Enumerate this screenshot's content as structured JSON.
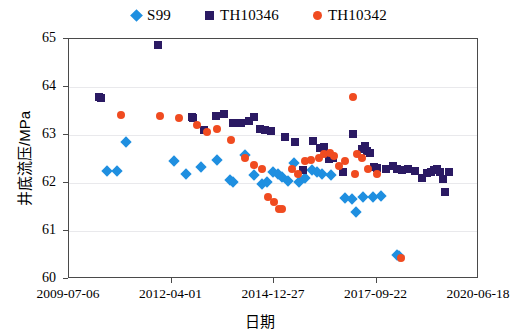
{
  "chart_data": {
    "type": "scatter",
    "title": "",
    "xlabel": "日期",
    "ylabel": "井底流压/MPa",
    "grid": true,
    "legend_position": "top-center",
    "ylim": [
      60,
      65
    ],
    "yticks": [
      60,
      61,
      62,
      63,
      64,
      65
    ],
    "ytick_labels": [
      "60",
      "61",
      "62",
      "63",
      "64",
      "65"
    ],
    "xlim": [
      "2009-07-06",
      "2020-06-18"
    ],
    "xticks": [
      "2009-07-06",
      "2012-04-01",
      "2014-12-27",
      "2017-09-22",
      "2020-06-18"
    ],
    "xtick_labels": [
      "2009-07-06",
      "2012-04-01",
      "2014-12-27",
      "2017-09-22",
      "2020-06-18"
    ],
    "x_axis_type": "date",
    "series": [
      {
        "name": "S99",
        "marker": "diamond",
        "color": "#1f8fe0",
        "points": [
          [
            0.092,
            62.26
          ],
          [
            0.116,
            62.26
          ],
          [
            0.14,
            62.85
          ],
          [
            0.255,
            62.45
          ],
          [
            0.285,
            62.18
          ],
          [
            0.323,
            62.33
          ],
          [
            0.36,
            62.48
          ],
          [
            0.392,
            62.07
          ],
          [
            0.4,
            62.02
          ],
          [
            0.43,
            62.58
          ],
          [
            0.452,
            62.16
          ],
          [
            0.47,
            61.97
          ],
          [
            0.482,
            62.02
          ],
          [
            0.497,
            62.22
          ],
          [
            0.51,
            62.18
          ],
          [
            0.52,
            62.13
          ],
          [
            0.533,
            62.05
          ],
          [
            0.548,
            62.42
          ],
          [
            0.56,
            62.02
          ],
          [
            0.575,
            62.1
          ],
          [
            0.592,
            62.27
          ],
          [
            0.604,
            62.23
          ],
          [
            0.618,
            62.18
          ],
          [
            0.64,
            62.16
          ],
          [
            0.672,
            61.68
          ],
          [
            0.69,
            61.66
          ],
          [
            0.7,
            61.4
          ],
          [
            0.716,
            61.7
          ],
          [
            0.742,
            61.7
          ],
          [
            0.762,
            61.72
          ],
          [
            0.8,
            60.5
          ],
          [
            0.805,
            60.48
          ]
        ]
      },
      {
        "name": "TH10346",
        "marker": "square",
        "color": "#2b1a63",
        "points": [
          [
            0.073,
            63.8
          ],
          [
            0.078,
            63.78
          ],
          [
            0.216,
            64.88
          ],
          [
            0.3,
            63.38
          ],
          [
            0.303,
            63.36
          ],
          [
            0.33,
            63.1
          ],
          [
            0.358,
            63.4
          ],
          [
            0.378,
            63.43
          ],
          [
            0.4,
            63.25
          ],
          [
            0.42,
            63.25
          ],
          [
            0.438,
            63.3
          ],
          [
            0.452,
            63.37
          ],
          [
            0.466,
            63.12
          ],
          [
            0.478,
            63.1
          ],
          [
            0.492,
            63.08
          ],
          [
            0.528,
            62.95
          ],
          [
            0.552,
            62.85
          ],
          [
            0.57,
            62.27
          ],
          [
            0.596,
            62.87
          ],
          [
            0.612,
            62.73
          ],
          [
            0.622,
            62.76
          ],
          [
            0.634,
            62.5
          ],
          [
            0.645,
            62.52
          ],
          [
            0.668,
            62.23
          ],
          [
            0.692,
            63.02
          ],
          [
            0.714,
            62.7
          ],
          [
            0.722,
            62.78
          ],
          [
            0.726,
            62.66
          ],
          [
            0.735,
            62.62
          ],
          [
            0.745,
            62.34
          ],
          [
            0.752,
            62.32
          ],
          [
            0.772,
            62.3
          ],
          [
            0.79,
            62.36
          ],
          [
            0.8,
            62.3
          ],
          [
            0.812,
            62.28
          ],
          [
            0.828,
            62.3
          ],
          [
            0.845,
            62.24
          ],
          [
            0.862,
            62.1
          ],
          [
            0.872,
            62.2
          ],
          [
            0.882,
            62.22
          ],
          [
            0.89,
            62.28
          ],
          [
            0.898,
            62.3
          ],
          [
            0.905,
            62.22
          ],
          [
            0.912,
            62.08
          ],
          [
            0.926,
            62.22
          ],
          [
            0.918,
            61.82
          ]
        ]
      },
      {
        "name": "TH10342",
        "marker": "circle",
        "color": "#f04b20",
        "points": [
          [
            0.128,
            63.42
          ],
          [
            0.222,
            63.4
          ],
          [
            0.268,
            63.35
          ],
          [
            0.312,
            63.2
          ],
          [
            0.336,
            63.06
          ],
          [
            0.36,
            63.12
          ],
          [
            0.395,
            62.9
          ],
          [
            0.43,
            62.52
          ],
          [
            0.452,
            62.38
          ],
          [
            0.47,
            62.3
          ],
          [
            0.486,
            61.7
          ],
          [
            0.5,
            61.6
          ],
          [
            0.512,
            61.46
          ],
          [
            0.52,
            61.45
          ],
          [
            0.545,
            62.3
          ],
          [
            0.558,
            62.18
          ],
          [
            0.575,
            62.45
          ],
          [
            0.59,
            62.47
          ],
          [
            0.61,
            62.52
          ],
          [
            0.622,
            62.6
          ],
          [
            0.637,
            62.62
          ],
          [
            0.646,
            62.56
          ],
          [
            0.658,
            62.35
          ],
          [
            0.672,
            62.45
          ],
          [
            0.692,
            63.8
          ],
          [
            0.702,
            62.6
          ],
          [
            0.715,
            62.52
          ],
          [
            0.73,
            62.3
          ],
          [
            0.698,
            62.18
          ],
          [
            0.752,
            62.18
          ],
          [
            0.81,
            60.44
          ]
        ]
      }
    ]
  },
  "legend": {
    "items": [
      {
        "label": "S99",
        "marker": "diamond",
        "color": "#1f8fe0"
      },
      {
        "label": "TH10346",
        "marker": "square",
        "color": "#2b1a63"
      },
      {
        "label": "TH10342",
        "marker": "circle",
        "color": "#f04b20"
      }
    ]
  }
}
